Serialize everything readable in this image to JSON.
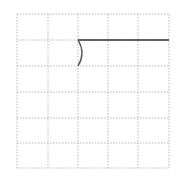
{
  "diagram": {
    "grid": {
      "columns": 5,
      "rows": 6,
      "left": 17,
      "top": 14,
      "right": 169,
      "bottom": 168,
      "line_color": "#b8b8b8",
      "line_style": "dotted"
    },
    "strokes": [
      {
        "type": "horizontal-line",
        "from": [
          78,
          40
        ],
        "to": [
          169,
          40
        ],
        "color": "#333333"
      },
      {
        "type": "arc",
        "from": [
          78,
          40
        ],
        "to": [
          78,
          66
        ],
        "bulge": "right",
        "color": "#555555"
      }
    ],
    "header_text_clipped": true
  }
}
